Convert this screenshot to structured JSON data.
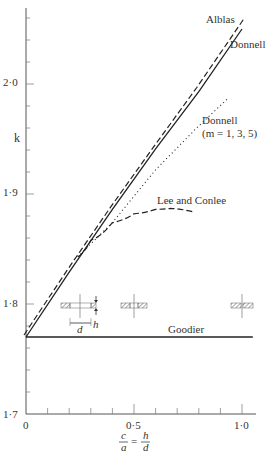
{
  "chart_data": {
    "type": "line",
    "title": "",
    "xlabel_num_left": "c",
    "xlabel_den_left": "a",
    "xlabel_eq": "=",
    "xlabel_num_right": "h",
    "xlabel_den_right": "d",
    "ylabel": "k",
    "xlim": [
      0,
      1.05
    ],
    "ylim": [
      1.7,
      2.07
    ],
    "grid": false,
    "legend_position": "inline labels",
    "x_ticks": [
      "0",
      "0·5",
      "1·0"
    ],
    "y_ticks": [
      "1·7",
      "1·8",
      "1·9",
      "2·0"
    ],
    "series": [
      {
        "name": "Alblas",
        "style": "dashed",
        "x": [
          0.0,
          0.2,
          0.4,
          0.6,
          0.8,
          1.02
        ],
        "y": [
          1.77,
          1.829,
          1.886,
          1.941,
          1.995,
          2.058
        ]
      },
      {
        "name": "Donnell",
        "style": "solid",
        "x": [
          0.0,
          0.2,
          0.4,
          0.6,
          0.8,
          1.0
        ],
        "y": [
          1.77,
          1.829,
          1.886,
          1.941,
          1.993,
          2.05
        ]
      },
      {
        "name": "Donnell (m = 1, 3, 5)",
        "style": "dotted",
        "x": [
          0.24,
          0.4,
          0.6,
          0.8,
          0.93
        ],
        "y": [
          1.843,
          1.874,
          1.922,
          1.962,
          1.986
        ]
      },
      {
        "name": "Lee and Conlee",
        "style": "dashed",
        "x": [
          0.24,
          0.3,
          0.4,
          0.5,
          0.6,
          0.67,
          0.77
        ],
        "y": [
          1.843,
          1.858,
          1.874,
          1.882,
          1.886,
          1.887,
          1.884
        ]
      },
      {
        "name": "Goodier",
        "style": "solid",
        "x": [
          0.0,
          1.05
        ],
        "y": [
          1.77,
          1.77
        ]
      }
    ],
    "annotations": [
      "Alblas",
      "Donnell",
      "Donnell",
      "(m = 1, 3, 5)",
      "Lee and Conlee",
      "Goodier",
      "d",
      "h"
    ]
  }
}
